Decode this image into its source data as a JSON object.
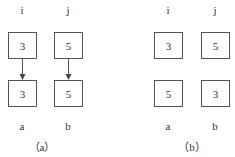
{
  "panels": [
    {
      "caption": "（a）",
      "top_labels": [
        "i",
        "j"
      ],
      "top_values": [
        "3",
        "5"
      ],
      "bottom_values": [
        "3",
        "5"
      ],
      "bottom_labels": [
        "a",
        "b"
      ],
      "arrows": true
    },
    {
      "caption": "（b）",
      "top_labels": [
        "i",
        "j"
      ],
      "top_values": [
        "3",
        "5"
      ],
      "bottom_values": [
        "5",
        "3"
      ],
      "bottom_labels": [
        "a",
        "b"
      ],
      "arrows": false
    }
  ]
}
